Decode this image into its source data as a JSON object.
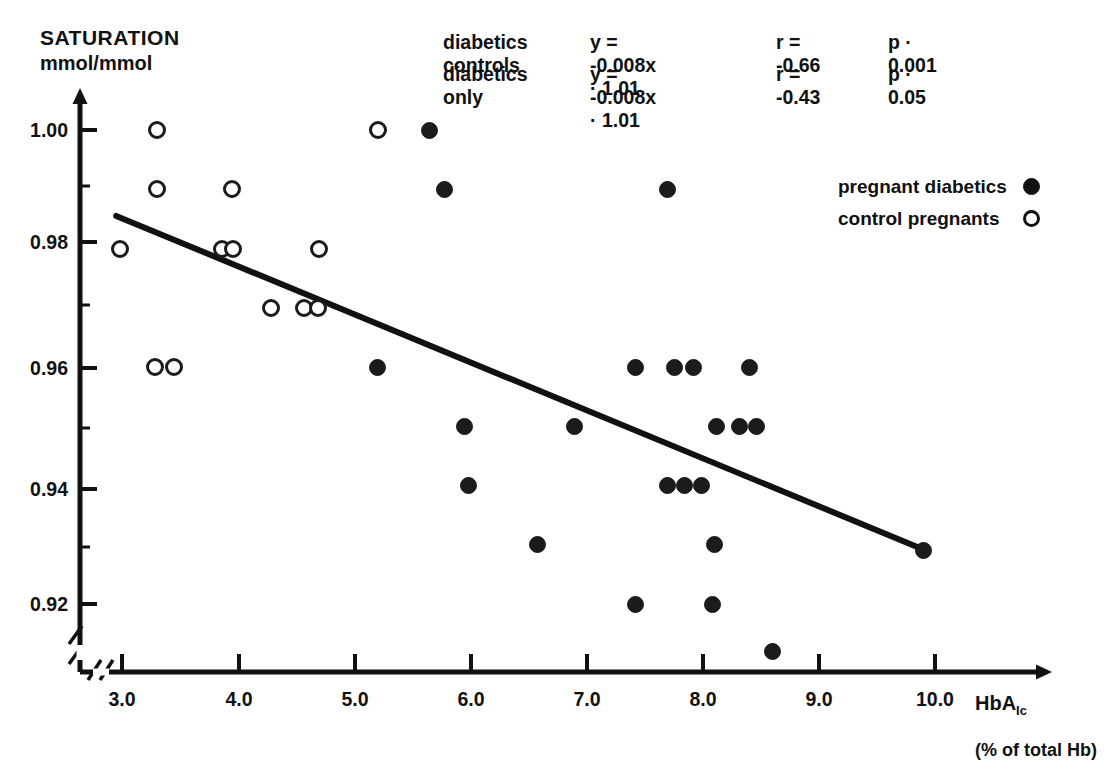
{
  "axis": {
    "y_title_line1": "SATURATION",
    "y_title_line2": "mmol/mmol",
    "x_title": "HbA",
    "x_title_sub": "Ic",
    "x_units": "(% of total Hb)",
    "y_ticks": [
      "1.00",
      "0.98",
      "0.96",
      "0.94",
      "0.92"
    ],
    "x_ticks": [
      "3.0",
      "4.0",
      "5.0",
      "6.0",
      "7.0",
      "8.0",
      "9.0",
      "10.0"
    ]
  },
  "annotations": [
    {
      "name": "diabetics   controls",
      "eqn": "y = -0.008x · 1.01",
      "r": "r = -0.66",
      "p": "p ·  0.001"
    },
    {
      "name": "diabetics only",
      "eqn": "y = -0.008x · 1.01",
      "r": "r = -0.43",
      "p": "p ·  0.05"
    }
  ],
  "legend": [
    {
      "label": "pregnant diabetics",
      "marker": "filled-circle"
    },
    {
      "label": "control pregnants",
      "marker": "open-circle"
    }
  ],
  "colors": {
    "ink": "#111111",
    "marker_fill": "#1b1b1b",
    "background": "#ffffff"
  },
  "chart_data": {
    "type": "scatter",
    "title": "",
    "xlabel": "HbA1c (% of total Hb)",
    "ylabel": "SATURATION mmol/mmol",
    "xlim": [
      2.75,
      10.35
    ],
    "ylim": [
      0.908,
      1.006
    ],
    "grid": false,
    "legend_position": "upper-right-inside",
    "axis_break": {
      "x": true,
      "y": true
    },
    "series": [
      {
        "name": "control pregnants",
        "marker": "open-circle",
        "points": [
          [
            3.3,
            1.0
          ],
          [
            5.2,
            1.0
          ],
          [
            3.3,
            0.99
          ],
          [
            3.95,
            0.99
          ],
          [
            2.98,
            0.98
          ],
          [
            3.86,
            0.98
          ],
          [
            3.96,
            0.98
          ],
          [
            4.7,
            0.98
          ],
          [
            4.28,
            0.97
          ],
          [
            4.57,
            0.97
          ],
          [
            4.69,
            0.97
          ],
          [
            3.28,
            0.96
          ],
          [
            3.45,
            0.96
          ]
        ]
      },
      {
        "name": "pregnant diabetics",
        "marker": "filled-circle",
        "points": [
          [
            5.65,
            1.0
          ],
          [
            5.78,
            0.99
          ],
          [
            7.7,
            0.99
          ],
          [
            5.2,
            0.96
          ],
          [
            7.42,
            0.96
          ],
          [
            7.76,
            0.96
          ],
          [
            7.92,
            0.96
          ],
          [
            8.4,
            0.96
          ],
          [
            5.95,
            0.95
          ],
          [
            6.9,
            0.95
          ],
          [
            8.12,
            0.95
          ],
          [
            8.32,
            0.95
          ],
          [
            8.46,
            0.95
          ],
          [
            5.98,
            0.94
          ],
          [
            7.7,
            0.94
          ],
          [
            7.84,
            0.94
          ],
          [
            7.99,
            0.94
          ],
          [
            6.58,
            0.93
          ],
          [
            8.1,
            0.93
          ],
          [
            9.9,
            0.929
          ],
          [
            7.42,
            0.92
          ],
          [
            8.08,
            0.92
          ],
          [
            8.6,
            0.912
          ]
        ]
      }
    ],
    "regression_line": {
      "label": "y = -0.008x + 1.01",
      "x_from": 2.95,
      "x_to": 9.9,
      "y_from": 0.9855,
      "y_to": 0.9292
    }
  }
}
